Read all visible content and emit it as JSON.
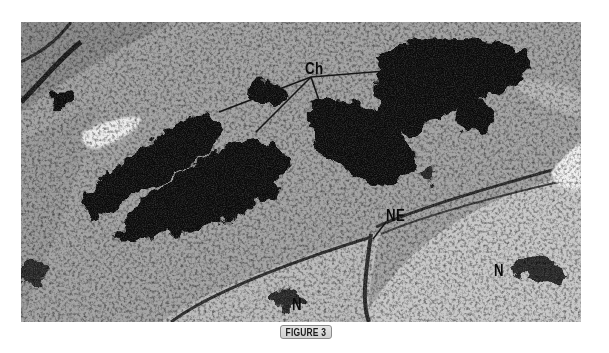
{
  "figure": {
    "caption": "FIGURE 3",
    "labels": {
      "chromatin": "Ch",
      "nuclear_envelope": "NE",
      "nucleus_right": "N",
      "nucleus_bottom": "N"
    },
    "colors": {
      "background": "#ffffff",
      "cytoplasm": "#a8a8a8",
      "chromatin": "#0d0d0d",
      "label_text": "#0a0a0a",
      "leader_line": "#1a1a1a",
      "badge_fill": "#d9d9d9",
      "badge_border": "#8a8a8a"
    },
    "leader_lines": {
      "origin": [
        311,
        77
      ],
      "targets": [
        [
          219,
          112
        ],
        [
          256,
          132
        ],
        [
          326,
          121
        ],
        [
          447,
          66
        ]
      ]
    }
  }
}
